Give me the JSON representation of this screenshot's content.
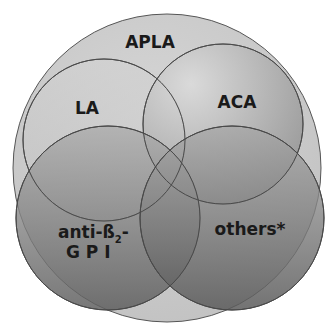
{
  "diagram": {
    "type": "venn",
    "outer": {
      "label": "APLA",
      "fill": "#c9c9c9"
    },
    "sets": [
      {
        "id": "la",
        "label": "LA"
      },
      {
        "id": "aca",
        "label": "ACA"
      },
      {
        "id": "anti-b2gpi",
        "label_line1": "anti-ß",
        "subscript": "2",
        "label_suffix": "-",
        "label_line2": "G P I"
      },
      {
        "id": "others",
        "label": "others*"
      }
    ],
    "colors": {
      "background": "#ffffff",
      "outline": "#555555",
      "text": "#1a1a1a"
    }
  }
}
